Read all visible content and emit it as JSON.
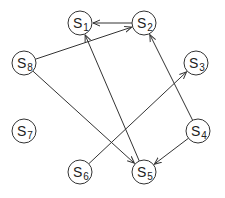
{
  "diagram": {
    "type": "directed-graph",
    "nodes": [
      {
        "id": "S1",
        "label": "S",
        "sub": "1",
        "x": 80,
        "y": 23
      },
      {
        "id": "S2",
        "label": "S",
        "sub": "2",
        "x": 144,
        "y": 23
      },
      {
        "id": "S3",
        "label": "S",
        "sub": "3",
        "x": 196,
        "y": 63
      },
      {
        "id": "S4",
        "label": "S",
        "sub": "4",
        "x": 198,
        "y": 131
      },
      {
        "id": "S5",
        "label": "S",
        "sub": "5",
        "x": 144,
        "y": 172
      },
      {
        "id": "S6",
        "label": "S",
        "sub": "6",
        "x": 80,
        "y": 172
      },
      {
        "id": "S7",
        "label": "S",
        "sub": "7",
        "x": 24,
        "y": 131
      },
      {
        "id": "S8",
        "label": "S",
        "sub": "8",
        "x": 24,
        "y": 63
      }
    ],
    "edges": [
      {
        "from": "S2",
        "to": "S1"
      },
      {
        "from": "S8",
        "to": "S2"
      },
      {
        "from": "S5",
        "to": "S1"
      },
      {
        "from": "S4",
        "to": "S2"
      },
      {
        "from": "S6",
        "to": "S3"
      },
      {
        "from": "S8",
        "to": "S5"
      },
      {
        "from": "S4",
        "to": "S5"
      }
    ],
    "node_radius": 12
  }
}
